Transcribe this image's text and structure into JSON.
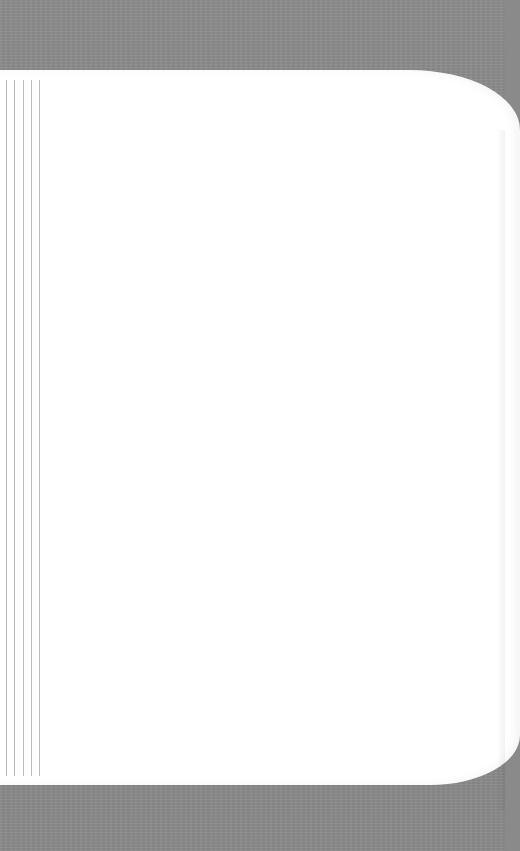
{
  "scene": {
    "type": "blank-page-photo",
    "background_color": "#8a8a8a",
    "page_color": "#ffffff",
    "margin_line_color": "#bdbdbd"
  },
  "page": {
    "text": "",
    "margin_lines": [
      {
        "x": 6
      },
      {
        "x": 14
      },
      {
        "x": 23
      },
      {
        "x": 31
      },
      {
        "x": 39
      }
    ]
  }
}
